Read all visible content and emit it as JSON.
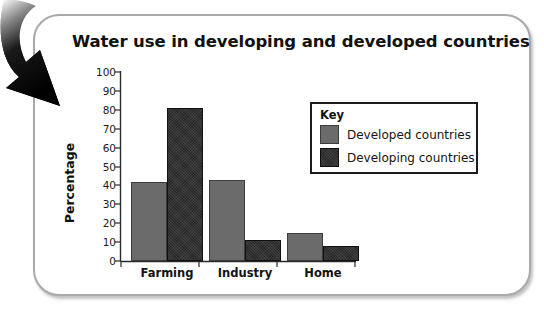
{
  "card": {
    "accent_border": "#a9a9ac",
    "background": "#ffffff"
  },
  "annotation": {
    "arrow_name": "curved-down-arrow",
    "color": "#000000"
  },
  "legend": {
    "title": "Key",
    "entries": [
      {
        "label": "Developed countries",
        "color": "#6b6b6b"
      },
      {
        "label": "Developing countries",
        "color": "#272727"
      }
    ]
  },
  "chart_data": {
    "type": "bar",
    "title": "Water use in developing and developed countries",
    "xlabel": "",
    "ylabel": "Percentage",
    "categories": [
      "Farming",
      "Industry",
      "Home"
    ],
    "series": [
      {
        "name": "Developed countries",
        "color": "#6b6b6b",
        "values": [
          42,
          43,
          15
        ]
      },
      {
        "name": "Developing countries",
        "color": "#272727",
        "values": [
          81,
          11,
          8
        ]
      }
    ],
    "ylim": [
      0,
      100
    ],
    "ytick_labels": [
      "100",
      "90",
      "80",
      "70",
      "60",
      "50",
      "40",
      "30",
      "20",
      "10",
      "0"
    ],
    "ytick_values": [
      100,
      90,
      80,
      70,
      60,
      50,
      40,
      30,
      20,
      10,
      0
    ],
    "grid": false,
    "legend_position": "inside-right"
  }
}
